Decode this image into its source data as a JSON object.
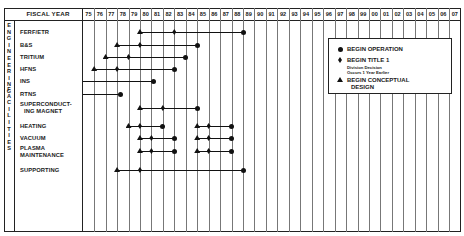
{
  "chart_data": {
    "type": "gantt",
    "header_label": "FISCAL YEAR",
    "years": [
      "75",
      "76",
      "77",
      "78",
      "79",
      "80",
      "81",
      "82",
      "83",
      "84",
      "85",
      "86",
      "87",
      "88",
      "89",
      "90",
      "91",
      "92",
      "93",
      "94",
      "95",
      "96",
      "97",
      "98",
      "99",
      "00",
      "01",
      "02",
      "03",
      "04",
      "05",
      "06",
      "07"
    ],
    "groups": [
      {
        "label": "ENGINEERING",
        "rows": [
          "FERF/ETR",
          "B&S",
          "TRITIUM",
          "HFNS",
          "INS",
          "RTNS"
        ]
      },
      {
        "label": "FACILITIES",
        "rows": [
          "SUPERCONDUCTING MAGNET",
          "HEATING",
          "VACUUM",
          "PLASMA MAINTENANCE",
          "SUPPORTING"
        ]
      }
    ],
    "rows": [
      {
        "label": "FERF/ETR",
        "phases": [
          {
            "conceptual_design": 80,
            "title_1": 83,
            "operation": 89
          }
        ]
      },
      {
        "label": "B&S",
        "phases": [
          {
            "conceptual_design": 78,
            "title_1": 80,
            "operation": 85
          }
        ]
      },
      {
        "label": "TRITIUM",
        "phases": [
          {
            "conceptual_design": 77,
            "title_1": 79,
            "operation": 84
          }
        ]
      },
      {
        "label": "HFNS",
        "phases": [
          {
            "conceptual_design": 76,
            "title_1": 78,
            "operation": 83
          }
        ]
      },
      {
        "label": "INS",
        "phases": [
          {
            "conceptual_design": null,
            "title_1": null,
            "operation": 81.2,
            "line_start": 75
          }
        ]
      },
      {
        "label": "RTNS",
        "phases": [
          {
            "conceptual_design": null,
            "title_1": null,
            "operation": 78.3,
            "line_start": 75
          }
        ]
      },
      {
        "label": "SUPERCONDUCTING MAGNET",
        "phases": [
          {
            "conceptual_design": 80,
            "title_1": 82,
            "operation": 85
          }
        ]
      },
      {
        "label": "HEATING",
        "phases": [
          {
            "conceptual_design": 79,
            "title_1": 80,
            "operation": 82
          },
          {
            "conceptual_design": 85,
            "title_1": 86,
            "operation": 88
          }
        ]
      },
      {
        "label": "VACUUM",
        "phases": [
          {
            "conceptual_design": 80,
            "title_1": 81,
            "operation": 83
          },
          {
            "conceptual_design": 85,
            "title_1": 86,
            "operation": 88
          }
        ]
      },
      {
        "label": "PLASMA MAINTENANCE",
        "phases": [
          {
            "conceptual_design": 80,
            "title_1": 81,
            "operation": 83
          },
          {
            "conceptual_design": 85,
            "title_1": 86,
            "operation": 88
          }
        ]
      },
      {
        "label": "SUPPORTING",
        "phases": [
          {
            "conceptual_design": 78,
            "title_1": 80,
            "operation": 89
          }
        ]
      }
    ],
    "legend": [
      {
        "marker": "circle",
        "label": "BEGIN OPERATION"
      },
      {
        "marker": "diamond",
        "label": "BEGIN TITLE 1",
        "note": [
          "Division Decision",
          "Occurs 1 Year Earlier"
        ]
      },
      {
        "marker": "triangle",
        "label": "BEGIN CONCEPTUAL DESIGN"
      }
    ],
    "grid": true,
    "legend_position": "upper-right inside plot"
  },
  "labels": {
    "fiscal_year": "FISCAL YEAR",
    "group_engineering": "ENGINEERING",
    "group_facilities": "FACILITIES",
    "rows": {
      "ferf": "FERF/ETR",
      "bs": "B&S",
      "tritium": "TRITIUM",
      "hfns": "HFNS",
      "ins": "INS",
      "rtns": "RTNS",
      "sc1": "SUPERCONDUCT-",
      "sc2": "ING MAGNET",
      "heating": "HEATING",
      "vacuum": "VACUUM",
      "pm1": "PLASMA",
      "pm2": "MAINTENANCE",
      "supporting": "SUPPORTING"
    },
    "legend": {
      "operation": "BEGIN OPERATION",
      "title1": "BEGIN TITLE 1",
      "note1": "Division Decision",
      "note2": "Occurs 1 Year Earlier",
      "concept1": "BEGIN CONCEPTUAL",
      "concept2": "DESIGN"
    }
  }
}
